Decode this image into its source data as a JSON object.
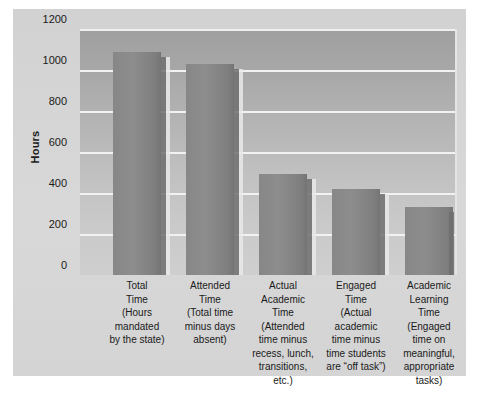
{
  "chart_data": {
    "type": "bar",
    "title": "",
    "xlabel": "",
    "ylabel": "Hours",
    "ylim": [
      0,
      1200
    ],
    "yticks": [
      1200,
      1000,
      800,
      600,
      400,
      200,
      0
    ],
    "grid": true,
    "legend": "none",
    "categories": [
      "Total\nTime",
      "Attended\nTime",
      "Actual\nAcademic\nTime",
      "Engaged\nTime",
      "Academic\nLearning\nTime"
    ],
    "category_descriptions": [
      "(Hours\nmandated\nby the state)",
      "(Total time\nminus days\nabsent)",
      "(Attended\ntime minus\nrecess, lunch,\ntransitions,\netc.)",
      "(Actual\nacademic\ntime minus\ntime students\nare “off task”)",
      "(Engaged\ntime on\nmeaningful,\nappropriate\ntasks)"
    ],
    "values": [
      1090,
      1030,
      495,
      420,
      330
    ],
    "bar_color": "#868686",
    "plot_background_top": "#9f9f9f",
    "plot_background_bottom": "#cfcfcf",
    "gridline_color": "#f2f2f2",
    "panel_color": "#d6d6d6"
  }
}
